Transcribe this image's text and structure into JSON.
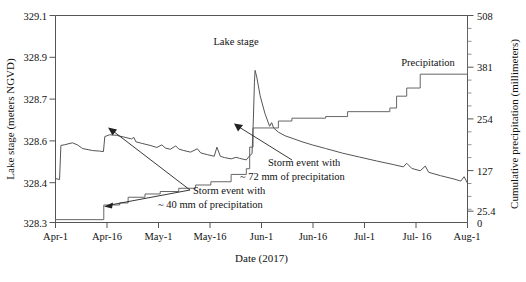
{
  "figure": {
    "background": "#ffffff",
    "line_color": "#555555",
    "text_color": "#111111"
  },
  "chart_data": {
    "type": "line",
    "title": "",
    "xlabel": "Date (2017)",
    "ylabel": "Lake stage (meters NGVD)",
    "y2label": "Cumulative precipitation (millimeters)",
    "grid": false,
    "legend_position": "inline-annotations",
    "x_ticklabels": [
      "Apr-1",
      "Apr-16",
      "May-1",
      "May-16",
      "Jun-1",
      "Jun-16",
      "Jul-1",
      "Jul- 16",
      "Aug-1"
    ],
    "y_ticklabels": [
      "329.1",
      "328.9",
      "328.7",
      "328.6",
      "328.4",
      "328.3"
    ],
    "y_tickvalues": [
      329.1,
      328.9,
      328.7,
      328.6,
      328.4,
      328.3
    ],
    "ylim": [
      328.3,
      329.1
    ],
    "y2_ticklabels": [
      "508",
      "381",
      "254",
      "127",
      "25.4",
      "0"
    ],
    "y2_tickvalues": [
      508,
      381,
      254,
      127,
      25.4,
      0
    ],
    "y2lim": [
      0,
      508
    ],
    "series": [
      {
        "name": "Lake stage",
        "axis": "left",
        "style": "line",
        "peak_value": 328.89,
        "peak_date": "May-18",
        "start_value": 328.47,
        "end_value": 328.34,
        "points": [
          [
            0,
            328.47
          ],
          [
            1.2,
            328.466
          ],
          [
            1.6,
            328.598
          ],
          [
            2.6,
            328.6
          ],
          [
            5,
            328.608
          ],
          [
            6.5,
            328.6
          ],
          [
            8,
            328.586
          ],
          [
            11,
            328.578
          ],
          [
            13,
            328.576
          ],
          [
            14.2,
            328.574
          ],
          [
            14.6,
            328.632
          ],
          [
            16,
            328.639
          ],
          [
            18,
            328.637
          ],
          [
            20,
            328.631
          ],
          [
            22.5,
            328.623
          ],
          [
            23.2,
            328.629
          ],
          [
            23.8,
            328.612
          ],
          [
            25.5,
            328.606
          ],
          [
            28,
            328.598
          ],
          [
            30,
            328.59
          ],
          [
            31.5,
            328.6
          ],
          [
            32.5,
            328.588
          ],
          [
            34,
            328.583
          ],
          [
            35.6,
            328.596
          ],
          [
            36.5,
            328.584
          ],
          [
            38,
            328.578
          ],
          [
            40,
            328.572
          ],
          [
            42,
            328.585
          ],
          [
            43,
            328.569
          ],
          [
            45,
            328.562
          ],
          [
            47,
            328.556
          ],
          [
            47.8,
            328.591
          ],
          [
            48.8,
            328.556
          ],
          [
            50,
            328.551
          ],
          [
            52,
            328.546
          ],
          [
            53.5,
            328.552
          ],
          [
            54.5,
            328.548
          ],
          [
            56.5,
            328.542
          ],
          [
            57.5,
            328.558
          ],
          [
            58.2,
            328.566
          ],
          [
            58.6,
            328.703
          ],
          [
            58.9,
            328.84
          ],
          [
            59.1,
            328.888
          ],
          [
            59.6,
            328.862
          ],
          [
            60.6,
            328.79
          ],
          [
            62,
            328.722
          ],
          [
            63.4,
            328.672
          ],
          [
            64,
            328.686
          ],
          [
            64.6,
            328.665
          ],
          [
            66,
            328.649
          ],
          [
            68,
            328.635
          ],
          [
            70,
            328.626
          ],
          [
            73,
            328.612
          ],
          [
            76,
            328.6
          ],
          [
            80,
            328.586
          ],
          [
            85,
            328.568
          ],
          [
            90,
            328.553
          ],
          [
            95,
            328.538
          ],
          [
            100,
            328.524
          ],
          [
            103,
            328.515
          ],
          [
            104,
            328.529
          ],
          [
            105.5,
            328.509
          ],
          [
            108,
            328.5
          ],
          [
            109.5,
            328.518
          ],
          [
            110.5,
            328.494
          ],
          [
            114,
            328.481
          ],
          [
            118,
            328.468
          ],
          [
            120,
            328.46
          ],
          [
            121,
            328.477
          ],
          [
            122,
            328.452
          ],
          [
            124,
            328.443
          ],
          [
            126,
            328.435
          ],
          [
            127.5,
            328.341
          ]
        ]
      },
      {
        "name": "Precipitation",
        "axis": "right",
        "style": "step",
        "start_value": 7,
        "end_value": 475,
        "points": [
          [
            0,
            7
          ],
          [
            14.3,
            7
          ],
          [
            14.3,
            43
          ],
          [
            19,
            43
          ],
          [
            19,
            48
          ],
          [
            21.5,
            48
          ],
          [
            21.5,
            62
          ],
          [
            26.5,
            62
          ],
          [
            26.5,
            70
          ],
          [
            31,
            70
          ],
          [
            31,
            76
          ],
          [
            36.5,
            76
          ],
          [
            36.5,
            84
          ],
          [
            41.5,
            84
          ],
          [
            41.5,
            92
          ],
          [
            46,
            92
          ],
          [
            46,
            100
          ],
          [
            52,
            100
          ],
          [
            52,
            118
          ],
          [
            56.5,
            118
          ],
          [
            56.5,
            132
          ],
          [
            57.5,
            132
          ],
          [
            57.5,
            185
          ],
          [
            58.5,
            185
          ],
          [
            58.5,
            232
          ],
          [
            66,
            232
          ],
          [
            66,
            249
          ],
          [
            70,
            249
          ],
          [
            70,
            256
          ],
          [
            80,
            256
          ],
          [
            80,
            260
          ],
          [
            86.5,
            260
          ],
          [
            86.5,
            272
          ],
          [
            99,
            272
          ],
          [
            99,
            281
          ],
          [
            101,
            281
          ],
          [
            101,
            310
          ],
          [
            104,
            310
          ],
          [
            104,
            330
          ],
          [
            108,
            330
          ],
          [
            108,
            364
          ],
          [
            124.5,
            364
          ],
          [
            124.5,
            390
          ],
          [
            127.5,
            390
          ],
          [
            127.5,
            475
          ]
        ]
      }
    ],
    "annotations": [
      {
        "name": "lake-stage-label",
        "text": "Lake stage",
        "x_px": 236,
        "y_px": 45
      },
      {
        "name": "precipitation-label",
        "text": "Precipitation",
        "x_px": 428,
        "y_px": 65
      },
      {
        "name": "storm-event-40mm",
        "line1": "Storm event with",
        "line2": "~ 40 mm of precipitation",
        "target": "precipitation step at Apr-16"
      },
      {
        "name": "storm-event-72mm",
        "line1": "Storm event with",
        "line2": "~ 72 mm of precipitation",
        "target": "lake stage rise at May-18"
      }
    ]
  },
  "caption": {
    "partial_text": ""
  }
}
